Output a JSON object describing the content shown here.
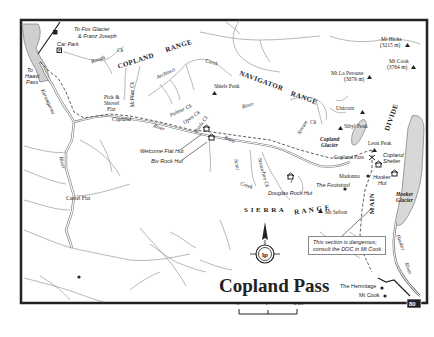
{
  "map": {
    "title": "Copland Pass",
    "scale": {
      "ticks": [
        "0",
        "2",
        "4 km"
      ]
    },
    "route_badge": "80",
    "note": [
      "This section is dangerous;",
      "consult the DOC in Mt Cook"
    ],
    "directions": {
      "fox_glacier": [
        "To Fox Glacier",
        "& Franz Joseph"
      ],
      "haast_pass": [
        "To",
        "Haast",
        "Pass"
      ]
    },
    "places": {
      "car_park": "Car Park",
      "pick_shovel": [
        "Pick &",
        "Shovel",
        "Flat"
      ],
      "cassel_flat": "Cassel Flat",
      "welcome_flat_hut": "Welcome Flat Hut",
      "biv_rock_hut": "Biv Rock Hut",
      "douglas_rock_hut": "Douglas Rock Hut",
      "the_footstool": "The Footstool",
      "madonna": "Madonna",
      "hooker_hut": [
        "Hooker",
        "Hut"
      ],
      "copland_shelter": [
        "Copland",
        "Shelter"
      ],
      "copland_pass": "Copland Pass",
      "the_hermitage": "The Hermitage",
      "mt_cook_village": "Mt Cook"
    },
    "peaks": {
      "mt_hicks": [
        "Mt Hicks",
        "(3215 m)"
      ],
      "mt_cook": [
        "Mt Cook",
        "(3764 m)"
      ],
      "mt_la_perouse": [
        "Mt La Perouse",
        "(3079 m)"
      ],
      "unicorn": "Unicorn",
      "sibyl_peak": "Sibyl Peak",
      "leon_peak": "Leon Peak",
      "shiels_peak": "Shiels Peak",
      "mt_sefton": "Mt Sefton"
    },
    "ranges": {
      "copland": "COPLAND",
      "range1": "RANGE",
      "navigator": "NAVIGATOR",
      "range2": "RANGE",
      "sierra": "S I E R R A",
      "range3": "R A N G E",
      "main": "MAIN",
      "divide": "DIVIDE"
    },
    "rivers": {
      "rough_ck": "Rough",
      "ck": "Ck",
      "mcphee_ck": "McPhee Ck",
      "architect": "Architect",
      "creek1": "Creek",
      "palmer_ck": "Palmer Ck",
      "open_ck": "Open Ck",
      "shiels_ck": "Shiels Ck",
      "copland": "Copland",
      "river1": "River",
      "karangarua": "Karangarua",
      "river2": "River",
      "river3": "River",
      "karo": "Karo",
      "scott": "Scott",
      "creek2": "Creek",
      "strauchon_ck": "Strauchon Ck",
      "hooker": "Hooker",
      "river4": "River",
      "ck2": "Ck",
      "stream": "Stream"
    },
    "glaciers": {
      "copland": [
        "Copland",
        "Glacier"
      ],
      "hooker": [
        "Hooker",
        "Glacier"
      ]
    },
    "colors": {
      "border": "#222222",
      "river": "#777777",
      "lake_fill": "#cfcfcf",
      "glacier_fill": "#d8d8d8",
      "text": "#222222"
    }
  }
}
